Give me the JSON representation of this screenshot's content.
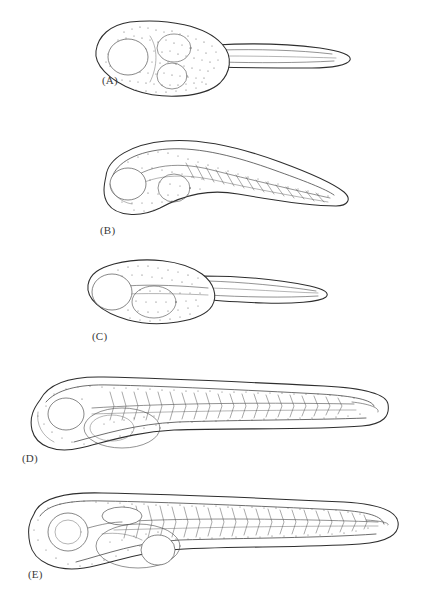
{
  "figure": {
    "kind": "scientific-line-drawing-plate",
    "background_color": "#ffffff",
    "ink_color": "#2e2e2e",
    "panel_count": 5,
    "label_style": "parenthesized-uppercase-letter"
  },
  "panels": [
    {
      "id": "A",
      "label": "(A)",
      "stage_name": "Early embryo on yolk, short tail",
      "orientation": "head-left, tail-right",
      "features": [
        "large round yolk mass",
        "optic vesicle",
        "otic vesicle",
        "short tapering tail",
        "fin fold",
        "stippled yolk surface"
      ]
    },
    {
      "id": "B",
      "label": "(B)",
      "stage_name": "Curved embryo wrapped over yolk",
      "orientation": "head-left, body arched downward, tail-right",
      "features": [
        "arched dorsal outline",
        "yolk mass ventral",
        "developing eye",
        "notochord line",
        "early myotomes"
      ]
    },
    {
      "id": "C",
      "label": "(C)",
      "stage_name": "Straightening embryo, elongating tail",
      "orientation": "head-left, tail-right",
      "features": [
        "prominent eye",
        "yolk sac",
        "notochord",
        "elongated tail",
        "fin fold"
      ]
    },
    {
      "id": "D",
      "label": "(D)",
      "stage_name": "Newly hatched larva",
      "orientation": "head-left, tail-right",
      "features": [
        "eye",
        "yolk sac",
        "segmented myotomes",
        "notochord",
        "continuous fin fold",
        "elongate trunk and tail"
      ]
    },
    {
      "id": "E",
      "label": "(E)",
      "stage_name": "Advanced larva with swim bladder",
      "orientation": "head-left, tail-right",
      "features": [
        "large pigmented eye",
        "swim bladder",
        "gut coil",
        "yolk remnant",
        "full myotome segmentation",
        "notochord",
        "caudal fin fold"
      ]
    }
  ]
}
